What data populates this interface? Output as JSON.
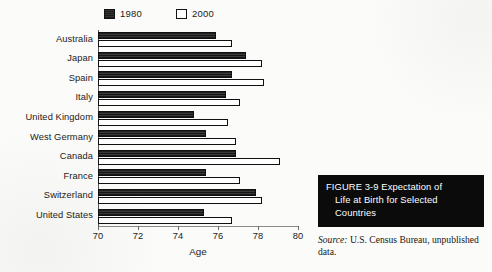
{
  "chart_data": {
    "type": "bar",
    "orientation": "horizontal",
    "title": "",
    "xlabel": "Age",
    "ylabel": "",
    "xlim": [
      70,
      80
    ],
    "xticks": [
      70,
      72,
      74,
      76,
      78,
      80
    ],
    "grid": false,
    "legend_position": "top",
    "categories": [
      "Australia",
      "Japan",
      "Spain",
      "Italy",
      "United Kingdom",
      "West Germany",
      "Canada",
      "France",
      "Switzerland",
      "United States"
    ],
    "series": [
      {
        "name": "1980",
        "color": "#1c1c1c",
        "values": [
          75.9,
          77.4,
          76.7,
          76.4,
          74.8,
          75.4,
          76.9,
          75.4,
          77.9,
          75.3
        ]
      },
      {
        "name": "2000",
        "color": "#ffffff",
        "values": [
          76.7,
          78.2,
          78.3,
          77.1,
          76.5,
          76.9,
          79.1,
          77.1,
          78.2,
          76.7
        ]
      }
    ]
  },
  "caption": {
    "line1": "FIGURE 3-9  Expectation of",
    "line2": "Life at Birth for Selected",
    "line3": "Countries"
  },
  "source": {
    "label": "Source:",
    "text": "U.S. Census Bureau, unpublished data."
  }
}
